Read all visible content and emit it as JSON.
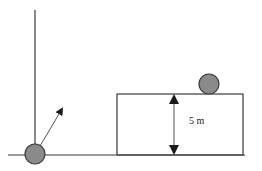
{
  "diagram": {
    "type": "physics-projectile",
    "height_label": "5 m",
    "elements": {
      "wall": "vertical reference line",
      "ground": "horizontal ground line",
      "launch_ball": "projectile ball at base of wall",
      "launch_arrow": "velocity vector pointing up-right",
      "platform": "raised platform / building",
      "target_ball": "ball resting on platform top",
      "height_dimension": "double-headed arrow indicating platform height"
    },
    "colors": {
      "ball_fill": "#8a8a8a",
      "stroke": "#3a3a3a"
    }
  }
}
